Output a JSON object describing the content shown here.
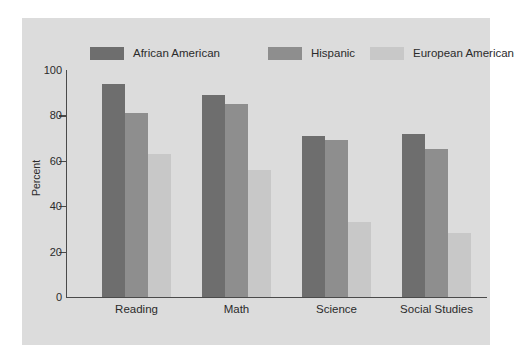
{
  "chart_data": {
    "type": "bar",
    "title": "",
    "xlabel": "",
    "ylabel": "Percent",
    "ylim": [
      0,
      100
    ],
    "yticks": [
      0,
      20,
      40,
      60,
      80,
      100
    ],
    "grid": false,
    "legend_position": "top",
    "categories": [
      "Reading",
      "Math",
      "Science",
      "Social Studies"
    ],
    "series": [
      {
        "name": "African American",
        "color": "#6e6e6e",
        "values": [
          94,
          89,
          71,
          72
        ]
      },
      {
        "name": "Hispanic",
        "color": "#8e8e8e",
        "values": [
          81,
          85,
          69,
          65
        ]
      },
      {
        "name": "European American",
        "color": "#c8c8c8",
        "values": [
          63,
          56,
          33,
          28
        ]
      }
    ]
  },
  "style": {
    "panel_background": "#dcdcdc",
    "figure_background": "#ffffff",
    "axis_color": "#4a4a4a",
    "text_color": "#2b2b2b"
  }
}
